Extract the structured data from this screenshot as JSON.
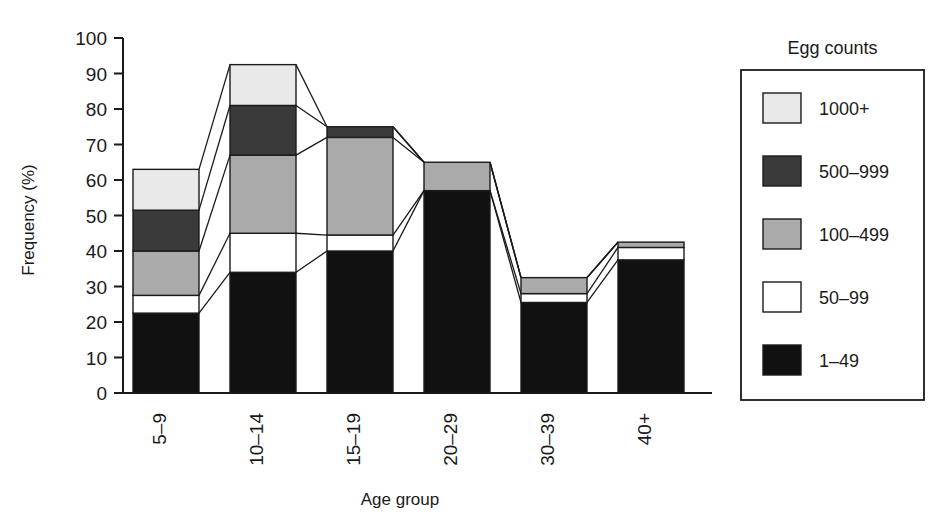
{
  "chart_data": {
    "type": "bar",
    "subtype": "stacked-bar-with-connectors",
    "title": "",
    "xlabel": "Age group",
    "ylabel": "Frequency (%)",
    "categories": [
      "5–9",
      "10–14",
      "15–19",
      "20–29",
      "30–39",
      "40+"
    ],
    "ylim": [
      0,
      100
    ],
    "yticks": [
      0,
      10,
      20,
      30,
      40,
      50,
      60,
      70,
      80,
      90,
      100
    ],
    "ytick_labels": [
      "0",
      "10",
      "20",
      "30",
      "40",
      "50",
      "60",
      "70",
      "80",
      "90",
      "100"
    ],
    "grid": false,
    "legend_position": "right",
    "legend_title": "Egg counts",
    "series": [
      {
        "name": "1–49",
        "color": "#111111",
        "values": [
          22.5,
          34.0,
          40.0,
          57.0,
          25.5,
          37.5
        ]
      },
      {
        "name": "50–99",
        "color": "#ffffff",
        "values": [
          5.0,
          11.0,
          4.5,
          0.0,
          2.5,
          3.5
        ]
      },
      {
        "name": "100–499",
        "color": "#aaaaaa",
        "values": [
          12.5,
          22.0,
          27.5,
          8.0,
          4.5,
          1.5
        ]
      },
      {
        "name": "500–999",
        "color": "#3a3a3a",
        "values": [
          11.5,
          14.0,
          3.0,
          0.0,
          0.0,
          0.0
        ]
      },
      {
        "name": "1000+",
        "color": "#e9e9e9",
        "values": [
          11.5,
          11.5,
          0.0,
          0.0,
          0.0,
          0.0
        ]
      }
    ],
    "cumulative_tops": [
      [
        22.5,
        27.5,
        40.0,
        51.5,
        63.0
      ],
      [
        34.0,
        45.0,
        67.0,
        81.0,
        92.5
      ],
      [
        40.0,
        44.5,
        72.0,
        75.0,
        75.0
      ],
      [
        57.0,
        57.0,
        65.0,
        65.0,
        65.0
      ],
      [
        25.5,
        28.0,
        32.5,
        32.5,
        32.5
      ],
      [
        37.5,
        41.0,
        42.5,
        42.5,
        42.5
      ]
    ],
    "bar_totals": [
      63.0,
      92.5,
      75.0,
      65.0,
      32.5,
      42.5
    ]
  },
  "legend": {
    "title": "Egg counts",
    "items": [
      {
        "label": "1000+",
        "color": "#e9e9e9"
      },
      {
        "label": "500–999",
        "color": "#3a3a3a"
      },
      {
        "label": "100–499",
        "color": "#aaaaaa"
      },
      {
        "label": "50–99",
        "color": "#ffffff"
      },
      {
        "label": "1–49",
        "color": "#111111"
      }
    ]
  },
  "axes": {
    "y_title": "Frequency (%)",
    "x_title": "Age group",
    "y_ticks": [
      "100",
      "90",
      "80",
      "70",
      "60",
      "50",
      "40",
      "30",
      "20",
      "10",
      "0"
    ],
    "x_ticks": [
      "5–9",
      "10–14",
      "15–19",
      "20–29",
      "30–39",
      "40+"
    ]
  }
}
